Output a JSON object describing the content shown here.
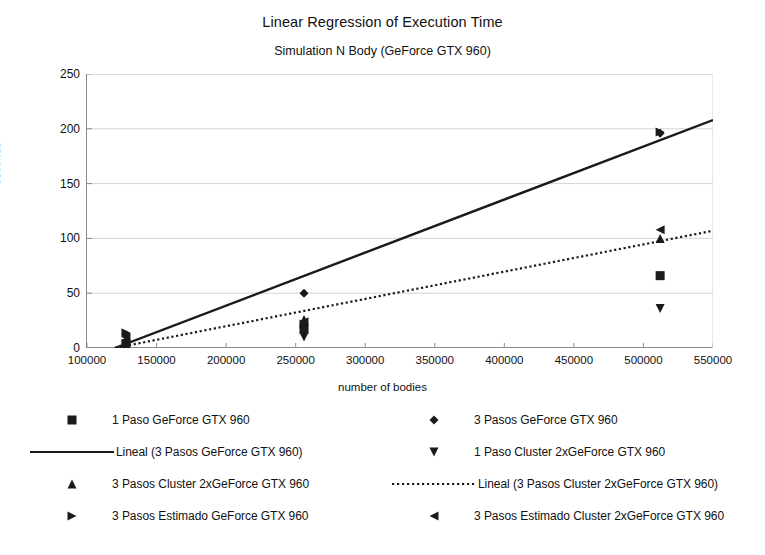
{
  "chart_data": {
    "type": "scatter",
    "title": "Linear Regression of Execution Time",
    "subtitle": "Simulation N Body (GeForce GTX 960)",
    "xlabel": "number of bodies",
    "ylabel": "seconds",
    "xlim": [
      100000,
      550000
    ],
    "ylim": [
      0,
      250
    ],
    "xticks": [
      100000,
      150000,
      200000,
      250000,
      300000,
      350000,
      400000,
      450000,
      500000,
      550000
    ],
    "yticks": [
      0,
      50,
      100,
      150,
      200,
      250
    ],
    "grid": "horizontal",
    "legend_position": "bottom",
    "series": [
      {
        "name": "1 Paso GeForce GTX 960",
        "marker": "square",
        "color": "#1a1a1a",
        "points": [
          {
            "x": 128000,
            "y": 4
          },
          {
            "x": 256000,
            "y": 17
          },
          {
            "x": 512000,
            "y": 66
          }
        ]
      },
      {
        "name": "3 Pasos GeForce GTX 960",
        "marker": "diamond",
        "color": "#1a1a1a",
        "points": [
          {
            "x": 128000,
            "y": 12
          },
          {
            "x": 256000,
            "y": 50
          },
          {
            "x": 512000,
            "y": 196
          }
        ]
      },
      {
        "name": "3 Pasos Cluster 2xGeForce GTX 960",
        "marker": "triangle-up",
        "color": "#1a1a1a",
        "points": [
          {
            "x": 128000,
            "y": 8
          },
          {
            "x": 256000,
            "y": 26
          },
          {
            "x": 512000,
            "y": 100
          }
        ]
      },
      {
        "name": "1 Paso Cluster 2xGeForce GTX 960",
        "marker": "triangle-down",
        "color": "#1a1a1a",
        "points": [
          {
            "x": 128000,
            "y": 3
          },
          {
            "x": 256000,
            "y": 10
          },
          {
            "x": 512000,
            "y": 36
          }
        ]
      },
      {
        "name": "3 Pasos Estimado GeForce GTX 960",
        "marker": "triangle-right",
        "color": "#1a1a1a",
        "points": [
          {
            "x": 128000,
            "y": 14
          },
          {
            "x": 256000,
            "y": 22
          },
          {
            "x": 512000,
            "y": 197
          }
        ]
      },
      {
        "name": "3 Pasos Estimado Cluster 2xGeForce GTX 960",
        "marker": "triangle-left",
        "color": "#1a1a1a",
        "points": [
          {
            "x": 128000,
            "y": 10
          },
          {
            "x": 256000,
            "y": 24
          },
          {
            "x": 512000,
            "y": 108
          }
        ]
      }
    ],
    "trendlines": [
      {
        "name": "Lineal (3 Pasos GeForce GTX 960)",
        "style": "solid",
        "color": "#1a1a1a",
        "x0": 120000,
        "y0": 0,
        "x1": 550000,
        "y1": 208
      },
      {
        "name": "Lineal (3 Pasos Cluster 2xGeForce GTX 960)",
        "style": "dotted",
        "color": "#1a1a1a",
        "x0": 120000,
        "y0": 0,
        "x1": 550000,
        "y1": 107
      }
    ]
  },
  "titles": {
    "main": "Linear Regression of Execution Time",
    "sub": "Simulation N Body (GeForce GTX 960)"
  },
  "axes": {
    "y_label": "seconds",
    "x_label": "number of bodies",
    "y_ticks": [
      "0",
      "50",
      "100",
      "150",
      "200",
      "250"
    ],
    "x_ticks": [
      "100000",
      "150000",
      "200000",
      "250000",
      "300000",
      "350000",
      "400000",
      "450000",
      "500000",
      "550000"
    ]
  },
  "legend": {
    "left": [
      {
        "label": "1 Paso GeForce GTX 960",
        "key": "square-marker"
      },
      {
        "label": "Lineal (3 Pasos GeForce GTX 960)",
        "key": "solid-line"
      },
      {
        "label": "3 Pasos Cluster 2xGeForce GTX 960",
        "key": "triangle-up-marker"
      },
      {
        "label": "3 Pasos Estimado GeForce GTX 960",
        "key": "triangle-right-marker"
      }
    ],
    "right": [
      {
        "label": "3 Pasos GeForce GTX 960",
        "key": "diamond-marker"
      },
      {
        "label": "1 Paso Cluster 2xGeForce GTX 960",
        "key": "triangle-down-marker"
      },
      {
        "label": "Lineal (3 Pasos Cluster 2xGeForce GTX 960)",
        "key": "dotted-line"
      },
      {
        "label": "3 Pasos Estimado Cluster 2xGeForce GTX 960",
        "key": "triangle-left-marker"
      }
    ]
  },
  "colors": {
    "ink": "#1a1a1a",
    "axis": "#8a8a8a",
    "grid": "#c9c9c9",
    "background": "#ffffff"
  }
}
